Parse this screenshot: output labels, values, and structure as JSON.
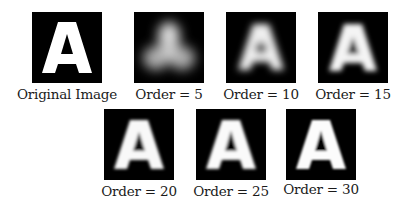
{
  "figure": {
    "panels": [
      {
        "label": "Original Image",
        "order": null,
        "blur": 0
      },
      {
        "label": "Order = 5",
        "order": 5,
        "blur": 9
      },
      {
        "label": "Order = 10",
        "order": 10,
        "blur": 4.5
      },
      {
        "label": "Order = 15",
        "order": 15,
        "blur": 3
      },
      {
        "label": "Order = 20",
        "order": 20,
        "blur": 2.2
      },
      {
        "label": "Order = 25",
        "order": 25,
        "blur": 1.8
      },
      {
        "label": "Order = 30",
        "order": 30,
        "blur": 1.4
      }
    ],
    "glyph": "A",
    "colors": {
      "background": "#000000",
      "glyph": "#ffffff",
      "page": "#ffffff",
      "text": "#1a1a1a"
    }
  }
}
